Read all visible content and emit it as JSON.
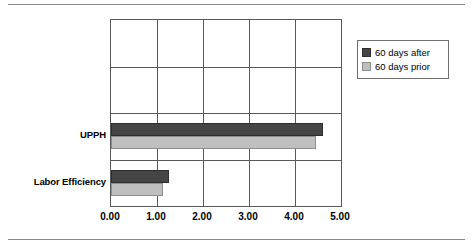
{
  "figure": {
    "has_top_rule": true,
    "has_bottom_rule": true,
    "rule_color": "#8a8a8a",
    "background": "#ffffff"
  },
  "legend": {
    "position": "right",
    "entries": [
      {
        "label": "60 days after",
        "color": "#454545",
        "swatch_name": "legend-swatch-after"
      },
      {
        "label": "60 days prior",
        "color": "#bfbfbf",
        "swatch_name": "legend-swatch-prior"
      }
    ]
  },
  "chart_data": {
    "type": "bar",
    "orientation": "horizontal",
    "title": "",
    "subtitle": "",
    "xlabel": "",
    "ylabel": "",
    "categories": [
      "UPPH",
      "Labor Efficiency"
    ],
    "series": [
      {
        "name": "60 days after",
        "color": "#454545",
        "values": [
          4.6,
          1.27
        ]
      },
      {
        "name": "60 days prior",
        "color": "#bfbfbf",
        "values": [
          4.45,
          1.14
        ]
      }
    ],
    "xlim": [
      0.0,
      5.0
    ],
    "xticks": [
      0.0,
      1.0,
      2.0,
      3.0,
      4.0,
      5.0
    ],
    "xtick_labels": [
      "0.00",
      "1.00",
      "2.00",
      "3.00",
      "4.00",
      "5.00"
    ],
    "grid": true,
    "grid_color": "#58595b",
    "legend_position": "right",
    "plot_border": true
  }
}
